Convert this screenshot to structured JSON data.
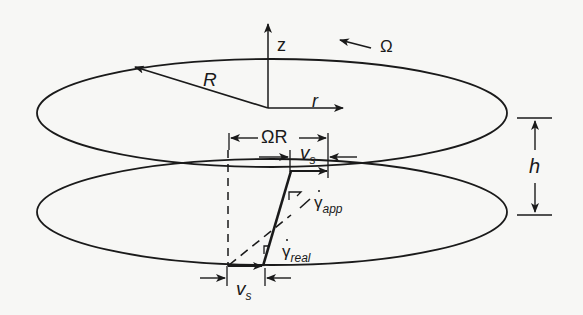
{
  "diagram": {
    "colors": {
      "stroke": "#1a1a1a",
      "background": "#f7f7f5"
    },
    "labels": {
      "z_axis": "z",
      "r_axis": "r",
      "radius": "R",
      "angular_velocity": "Ω",
      "rim_velocity": "ΩR",
      "slip_velocity_top": "v",
      "slip_velocity_top_sub": "s",
      "slip_velocity_bottom": "v",
      "slip_velocity_bottom_sub": "s",
      "gap": "h",
      "gamma_app": "γ",
      "gamma_app_sub": "app",
      "gamma_real": "γ",
      "gamma_real_sub": "real"
    },
    "elements": [
      "top-plate-ellipse",
      "bottom-plate-ellipse",
      "z-axis-arrow",
      "r-axis-arrow",
      "radius-arrow",
      "rotation-arrow",
      "rim-velocity-dimension",
      "top-slip-dimension",
      "bottom-slip-dimension",
      "gap-dimension",
      "real-velocity-profile-line",
      "apparent-velocity-profile-dashed-line",
      "reference-dashed-vertical"
    ]
  }
}
